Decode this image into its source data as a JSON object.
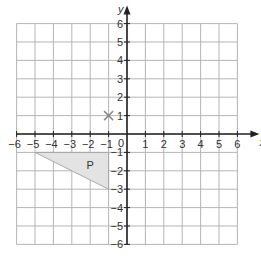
{
  "diagram": {
    "type": "coordinate_grid",
    "x_axis": {
      "label": "x",
      "min": -6,
      "max": 6,
      "ticks": [
        -6,
        -5,
        -4,
        -3,
        -2,
        -1,
        1,
        2,
        3,
        4,
        5,
        6
      ]
    },
    "y_axis": {
      "label": "y",
      "min": -6,
      "max": 6,
      "ticks": [
        -6,
        -5,
        -4,
        -3,
        -2,
        -1,
        1,
        2,
        3,
        4,
        5,
        6
      ]
    },
    "origin_label": "0",
    "shapes": [
      {
        "name": "P",
        "label": "P",
        "vertices": [
          [
            -5,
            -1
          ],
          [
            -1,
            -1
          ],
          [
            -1,
            -3
          ]
        ],
        "fill": "#e3e3e3",
        "label_pos": [
          -2,
          -1.7
        ]
      }
    ],
    "markers": [
      {
        "type": "cross",
        "position": [
          -1,
          1
        ]
      }
    ],
    "colors": {
      "grid": "#b5b5b5",
      "axis": "#222222",
      "text": "#333333",
      "cross": "#8a8a8a"
    }
  }
}
